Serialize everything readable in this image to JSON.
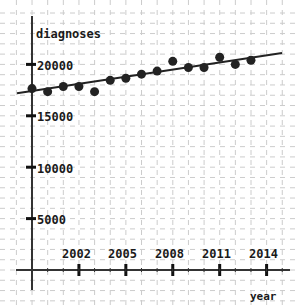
{
  "chart_data": {
    "type": "scatter",
    "title": "",
    "xlabel": "year",
    "ylabel": "diagnoses",
    "x_ticks": [
      2002,
      2005,
      2008,
      2011,
      2014
    ],
    "y_ticks": [
      5000,
      10000,
      15000,
      20000
    ],
    "xlim": [
      1998,
      2015
    ],
    "ylim": [
      -1500,
      23000
    ],
    "grid": true,
    "legend": null,
    "series": [
      {
        "name": "diagnoses",
        "type": "scatter",
        "x": [
          1999,
          2000,
          2001,
          2002,
          2003,
          2004,
          2005,
          2006,
          2007,
          2008,
          2009,
          2010,
          2011,
          2012,
          2013
        ],
        "y": [
          17650,
          17350,
          17850,
          17850,
          17350,
          18450,
          18650,
          19050,
          19350,
          20300,
          19700,
          19700,
          20700,
          20000,
          20400
        ]
      },
      {
        "name": "trend",
        "type": "line",
        "x": [
          1998,
          2015
        ],
        "y": [
          17200,
          21100
        ]
      }
    ]
  },
  "labels": {
    "ylabel": "diagnoses",
    "xlabel": "year",
    "y_ticks": [
      "20000",
      "15000",
      "10000",
      "5000"
    ],
    "x_ticks": [
      "2002",
      "2005",
      "2008",
      "2011",
      "2014"
    ]
  },
  "colors": {
    "axis": "#333333",
    "grid": "#cccccc",
    "points": "#222222",
    "line": "#222222"
  }
}
